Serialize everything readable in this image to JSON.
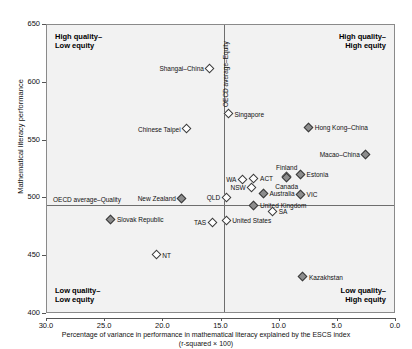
{
  "chart_data": {
    "type": "scatter",
    "title": "",
    "xlabel": "Percentage of variance in performance in mathematical literacy explained by the ESCS index",
    "xlabel_sub": "(r-squared × 100)",
    "ylabel": "Mathematical literacy performance",
    "xlim": [
      30.0,
      0.0
    ],
    "xticks": [
      "30.0",
      "25.0",
      "20.0",
      "15.0",
      "10.0",
      "5.0",
      "0.0"
    ],
    "xtick_values": [
      30.0,
      25.0,
      20.0,
      15.0,
      10.0,
      5.0,
      0.0
    ],
    "ylim": [
      400,
      650
    ],
    "yticks": [
      "650",
      "600",
      "550",
      "500",
      "450",
      "400"
    ],
    "ytick_values": [
      650,
      600,
      550,
      500,
      450,
      400
    ],
    "grid": false,
    "reference_lines": [
      {
        "name": "oecd-average-equity",
        "orientation": "vertical",
        "value": 14.8,
        "label": "OECD average–Equity"
      },
      {
        "name": "oecd-average-quality",
        "orientation": "horizontal",
        "value": 494,
        "label": "OECD average–Quality"
      }
    ],
    "quadrant_labels": {
      "top_left": "High quality–\nLow equity",
      "top_left_line1": "High quality–",
      "top_left_line2": "Low equity",
      "top_right_line1": "High quality–",
      "top_right_line2": "High equity",
      "bottom_left_line1": "Low quality–",
      "bottom_left_line2": "Low equity",
      "bottom_right_line1": "Low quality–",
      "bottom_right_line2": "High equity"
    },
    "points": [
      {
        "label": "Shangai–China",
        "x": 16.0,
        "y": 612,
        "marker": "open",
        "lab": "left"
      },
      {
        "label": "Singapore",
        "x": 14.4,
        "y": 573,
        "marker": "open",
        "lab": "right"
      },
      {
        "label": "Chinese Taipei",
        "x": 18.0,
        "y": 560,
        "marker": "open",
        "lab": "left"
      },
      {
        "label": "Hong Kong–China",
        "x": 7.5,
        "y": 561,
        "marker": "filled",
        "lab": "right"
      },
      {
        "label": "Macao–China",
        "x": 2.6,
        "y": 538,
        "marker": "filled",
        "lab": "left"
      },
      {
        "label": "Finland",
        "x": 9.4,
        "y": 519,
        "marker": "filled",
        "lab": "above"
      },
      {
        "label": "Estonia",
        "x": 8.2,
        "y": 521,
        "marker": "filled",
        "lab": "right"
      },
      {
        "label": "Canada",
        "x": 9.4,
        "y": 518,
        "marker": "filled",
        "lab": "below"
      },
      {
        "label": "WA",
        "x": 13.2,
        "y": 516,
        "marker": "open",
        "lab": "left"
      },
      {
        "label": "ACT",
        "x": 12.2,
        "y": 517,
        "marker": "open",
        "lab": "right"
      },
      {
        "label": "NSW",
        "x": 12.4,
        "y": 509,
        "marker": "open",
        "lab": "left"
      },
      {
        "label": "Australia",
        "x": 11.4,
        "y": 504,
        "marker": "filled",
        "lab": "right"
      },
      {
        "label": "VIC",
        "x": 8.2,
        "y": 503,
        "marker": "filled",
        "lab": "right"
      },
      {
        "label": "QLD",
        "x": 14.6,
        "y": 501,
        "marker": "open",
        "lab": "left"
      },
      {
        "label": "New Zealand",
        "x": 18.4,
        "y": 500,
        "marker": "filled",
        "lab": "left"
      },
      {
        "label": "United Kingdom",
        "x": 12.2,
        "y": 494,
        "marker": "filled",
        "lab": "right"
      },
      {
        "label": "SA",
        "x": 10.6,
        "y": 489,
        "marker": "open",
        "lab": "right"
      },
      {
        "label": "United States",
        "x": 14.6,
        "y": 481,
        "marker": "open",
        "lab": "right"
      },
      {
        "label": "TAS",
        "x": 15.8,
        "y": 479,
        "marker": "open",
        "lab": "left"
      },
      {
        "label": "Slovak Republic",
        "x": 24.5,
        "y": 482,
        "marker": "filled",
        "lab": "right"
      },
      {
        "label": "NT",
        "x": 20.6,
        "y": 451,
        "marker": "open",
        "lab": "right"
      },
      {
        "label": "Kazakhstan",
        "x": 8.0,
        "y": 432,
        "marker": "filled",
        "lab": "right"
      }
    ]
  }
}
